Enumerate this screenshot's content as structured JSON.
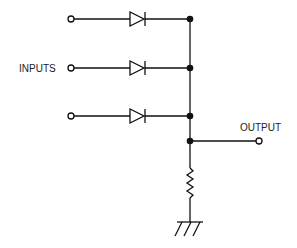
{
  "diagram": {
    "type": "diode OR gate circuit",
    "labels": {
      "inputs": "INPUTS",
      "output": "OUTPUT"
    },
    "components": {
      "input_terminals": 3,
      "diodes": 3,
      "junction_dots": 4,
      "resistor": 1,
      "ground": 1,
      "output_terminal": 1
    },
    "colors": {
      "line": "#111111",
      "background": "#ffffff"
    }
  }
}
